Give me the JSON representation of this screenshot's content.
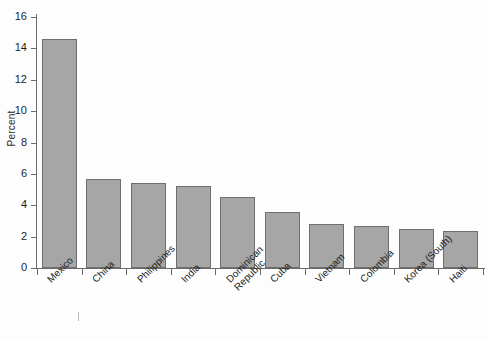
{
  "chart_data": {
    "type": "bar",
    "title": "",
    "xlabel": "",
    "ylabel": "Percent",
    "ylim": [
      0,
      16
    ],
    "ytick_values": [
      0,
      2,
      4,
      6,
      8,
      10,
      12,
      14,
      16
    ],
    "ytick_labels": [
      "0",
      "2",
      "4",
      "6",
      "8",
      "10",
      "12",
      "14",
      "16"
    ],
    "grid": false,
    "legend": null,
    "bar_color": "#a6a6a6",
    "bar_edge_color": "#6f6f6f",
    "categories": [
      "Mexico",
      "China",
      "Philippines",
      "India",
      "Dominican Republic",
      "Cuba",
      "Vietnam",
      "Colombia",
      "Korea (South)",
      "Haiti"
    ],
    "values": [
      14.6,
      5.7,
      5.4,
      5.2,
      4.5,
      3.6,
      2.8,
      2.7,
      2.5,
      2.35
    ]
  }
}
